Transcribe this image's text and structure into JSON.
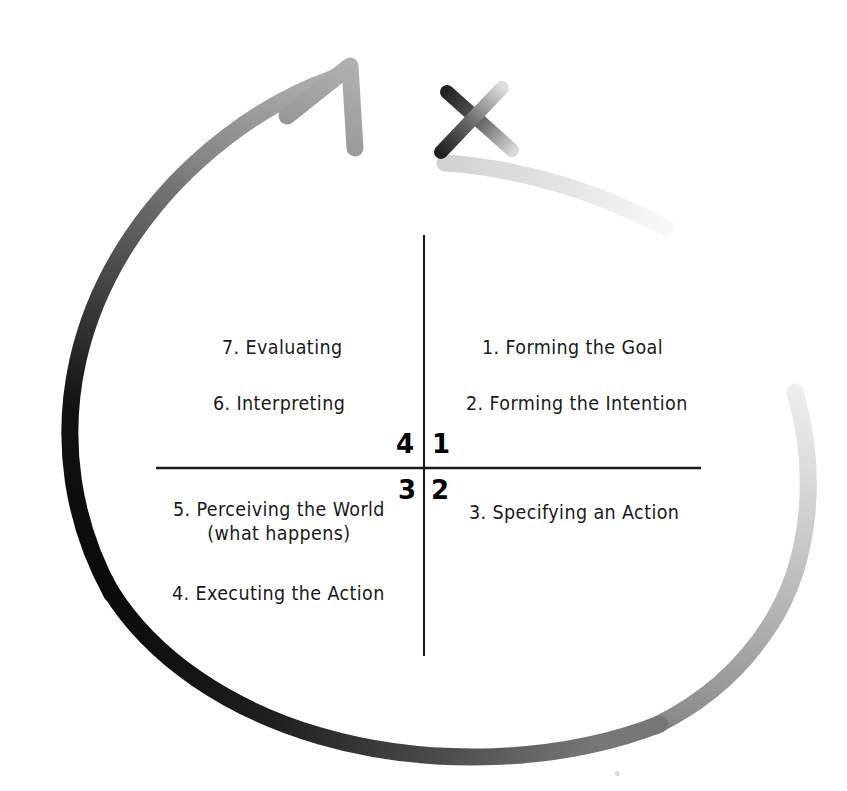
{
  "diagram": {
    "background_color": "#ffffff",
    "ink_color": "#1a1a1a",
    "axes": {
      "vertical_line": {
        "x": 424,
        "y_top": 235,
        "y_bottom": 656,
        "color": "#1a1a1a"
      },
      "horizontal_line": {
        "y": 468,
        "x_left": 156,
        "x_right": 701,
        "color": "#1a1a1a"
      }
    },
    "quadrant_numbers": [
      {
        "label": "4",
        "position": "upper-left-of-origin",
        "x": 399,
        "y": 434
      },
      {
        "label": "1",
        "position": "upper-right-of-origin",
        "x": 432,
        "y": 434
      },
      {
        "label": "3",
        "position": "lower-left-of-origin",
        "x": 400,
        "y": 475
      },
      {
        "label": "2",
        "position": "lower-right-of-origin",
        "x": 432,
        "y": 475
      }
    ],
    "stages": [
      {
        "number": "1",
        "text": "1.  Forming the Goal",
        "quadrant": "1",
        "x": 482,
        "y": 338
      },
      {
        "number": "2",
        "text": "2.  Forming the Intention",
        "quadrant": "1",
        "x": 466,
        "y": 394
      },
      {
        "number": "3",
        "text": "3.  Specifying an Action",
        "quadrant": "2",
        "x": 469,
        "y": 503
      },
      {
        "number": "4",
        "text": "4.  Executing the Action",
        "quadrant": "3",
        "x": 172,
        "y": 584
      },
      {
        "number": "5",
        "text": "5.  Perceiving the World\n(what happens)",
        "quadrant": "3",
        "x": 173,
        "y": 500
      },
      {
        "number": "6",
        "text": "6.  Interpreting",
        "quadrant": "4",
        "x": 213,
        "y": 394
      },
      {
        "number": "7",
        "text": "7.  Evaluating",
        "quadrant": "4",
        "x": 222,
        "y": 338
      }
    ],
    "loop_arrow": {
      "name": "action-cycle-loop",
      "description": "large counterclockwise looping arrow with grayscale gradient from light at tail to black at left and back to gray at arrowhead",
      "gradient_stops": [
        "#e8e8e8",
        "#bdbdbd",
        "#8a8a8a",
        "#3a3a3a",
        "#0d0d0d",
        "#111111",
        "#4a4a4a",
        "#9a9a9a",
        "#b5b5b5"
      ],
      "stroke_width": 16,
      "arrowhead": {
        "x": 340,
        "y": 72,
        "color": "#9b9b9b",
        "direction": "up-right"
      }
    },
    "cross_out_mark": {
      "name": "cross-out-x",
      "description": "dark X drawn over the loop tail indicating the cycle is broken",
      "stroke1": {
        "from": [
          447,
          91
        ],
        "to": [
          512,
          150
        ],
        "color_from": "#2b2b2b",
        "color_to": "#cfcfcf"
      },
      "stroke2": {
        "from": [
          500,
          88
        ],
        "to": [
          441,
          152
        ],
        "color_from": "#d6d6d6",
        "color_to": "#2b2b2b"
      }
    },
    "artifact": {
      "name": "scan-speck",
      "x": 615,
      "y": 771
    }
  }
}
